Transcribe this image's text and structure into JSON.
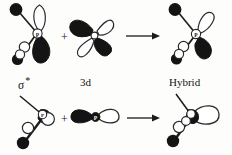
{
  "figure": {
    "background_color": "#fdfdfc",
    "ink_color": "#171717",
    "lobe_fill_color": "#1a1a1a",
    "lobe_empty_color": "#ffffff"
  },
  "labels": {
    "sigma_star": "σ",
    "sigma_star_mark": "*",
    "three_d": "3d",
    "hybrid": "Hybrid"
  },
  "operators": {
    "plus_top": "+",
    "plus_bottom": "+"
  },
  "rows": [
    {
      "name": "top-row",
      "terms": [
        {
          "name": "sigma-star-orbital",
          "label": "σ *",
          "description": "antibonding sigma orbital on P center with axial substituent",
          "center_atom": "P"
        },
        {
          "name": "three-d-orbital",
          "label": "3d",
          "description": "four-lobed d orbital, alternating filled and unfilled lobes",
          "center_atom": "P"
        },
        {
          "name": "hybrid-orbital",
          "label": "Hybrid",
          "description": "resulting hybrid orbital",
          "center_atom": "P"
        }
      ],
      "arrow": "→"
    },
    {
      "name": "bottom-row",
      "terms": [
        {
          "name": "sigma-star-orbital-lower",
          "label": "",
          "description": "sigma orbital on P center, rotated view",
          "center_atom": "P"
        },
        {
          "name": "p-orbital",
          "label": "",
          "description": "two-lobed p orbital, one filled one unfilled",
          "center_atom": "P"
        },
        {
          "name": "hybrid-orbital-lower",
          "label": "",
          "description": "resulting hybrid orbital, rotated view",
          "center_atom": "P"
        }
      ],
      "arrow": "→"
    }
  ],
  "atom_labels": {
    "p_center": "P"
  }
}
